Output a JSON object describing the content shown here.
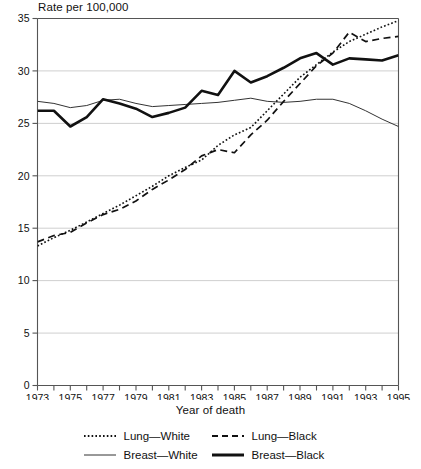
{
  "chart_data": {
    "type": "line",
    "title": "",
    "ylabel": "Rate per 100,000",
    "xlabel": "Year of death",
    "xlim": [
      1973,
      1995
    ],
    "ylim": [
      0,
      35
    ],
    "yticks": [
      0,
      5,
      10,
      15,
      20,
      25,
      30,
      35
    ],
    "ytick_labels": [
      "0",
      "5",
      "10",
      "15",
      "20",
      "25",
      "30",
      "35"
    ],
    "xticks": [
      1973,
      1974,
      1975,
      1976,
      1977,
      1978,
      1979,
      1980,
      1981,
      1982,
      1983,
      1984,
      1985,
      1986,
      1987,
      1988,
      1989,
      1990,
      1991,
      1992,
      1993,
      1994,
      1995
    ],
    "xtick_labels": [
      "1973",
      "",
      "1975",
      "",
      "1977",
      "",
      "1979",
      "",
      "1981",
      "",
      "1983",
      "",
      "1985",
      "",
      "1987",
      "",
      "1989",
      "",
      "1991",
      "",
      "1993",
      "",
      "1995"
    ],
    "grid": "horizontal",
    "legend_position": "below",
    "x": [
      1973,
      1974,
      1975,
      1976,
      1977,
      1978,
      1979,
      1980,
      1981,
      1982,
      1983,
      1984,
      1985,
      1986,
      1987,
      1988,
      1989,
      1990,
      1991,
      1992,
      1993,
      1994,
      1995
    ],
    "series": [
      {
        "name": "Lung—White",
        "style": "dotted",
        "color": "#111111",
        "width": 1.6,
        "values": [
          13.3,
          14.1,
          14.8,
          15.6,
          16.4,
          17.2,
          18.1,
          19.0,
          20.0,
          20.8,
          21.5,
          22.9,
          23.9,
          24.6,
          26.2,
          27.8,
          29.4,
          30.6,
          31.8,
          32.8,
          33.5,
          34.2,
          34.8
        ]
      },
      {
        "name": "Lung—Black",
        "style": "dashed",
        "color": "#111111",
        "width": 1.7,
        "values": [
          13.7,
          14.3,
          14.6,
          15.5,
          16.3,
          16.8,
          17.6,
          18.7,
          19.6,
          20.6,
          21.9,
          22.5,
          22.2,
          23.9,
          25.3,
          27.1,
          28.8,
          30.5,
          31.7,
          33.7,
          32.8,
          33.1,
          33.3
        ]
      },
      {
        "name": "Breast—White",
        "style": "solid-thin",
        "color": "#333333",
        "width": 1.0,
        "values": [
          27.1,
          26.9,
          26.5,
          26.7,
          27.2,
          27.3,
          26.9,
          26.6,
          26.7,
          26.8,
          26.9,
          27.0,
          27.2,
          27.4,
          27.1,
          27.0,
          27.1,
          27.3,
          27.3,
          26.9,
          26.2,
          25.4,
          24.7
        ]
      },
      {
        "name": "Breast—Black",
        "style": "solid-thick",
        "color": "#111111",
        "width": 2.6,
        "values": [
          26.2,
          26.2,
          24.7,
          25.6,
          27.3,
          26.9,
          26.4,
          25.6,
          26.0,
          26.5,
          28.1,
          27.7,
          30.0,
          28.9,
          29.5,
          30.3,
          31.2,
          31.7,
          30.6,
          31.2,
          31.1,
          31.0,
          31.5
        ]
      }
    ],
    "legend": [
      {
        "label": "Lung—White",
        "style": "dotted"
      },
      {
        "label": "Lung—Black",
        "style": "dashed"
      },
      {
        "label": "Breast—White",
        "style": "solid-thin"
      },
      {
        "label": "Breast—Black",
        "style": "solid-thick"
      }
    ]
  }
}
